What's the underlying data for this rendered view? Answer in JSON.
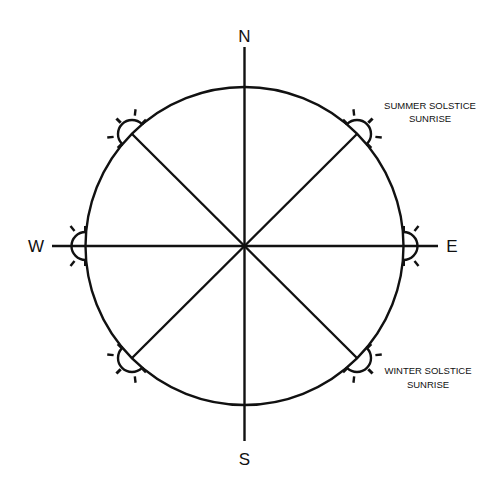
{
  "diagram": {
    "stroke_color": "#111111",
    "background": "#ffffff",
    "directions": {
      "north": "N",
      "south": "S",
      "east": "E",
      "west": "W"
    },
    "annotations": {
      "summer": {
        "line1": "SUMMER SOLSTICE",
        "line2": "SUNRISE"
      },
      "winter": {
        "line1": "WINTER SOLSTICE",
        "line2": "SUNRISE"
      }
    },
    "sun_markers": [
      {
        "position": "northeast",
        "label": "summer-solstice-sunrise"
      },
      {
        "position": "east",
        "label": "equinox-sunrise"
      },
      {
        "position": "southeast",
        "label": "winter-solstice-sunrise"
      },
      {
        "position": "northwest",
        "label": "summer-solstice-sunset"
      },
      {
        "position": "west",
        "label": "equinox-sunset"
      },
      {
        "position": "southwest",
        "label": "winter-solstice-sunset"
      }
    ]
  }
}
